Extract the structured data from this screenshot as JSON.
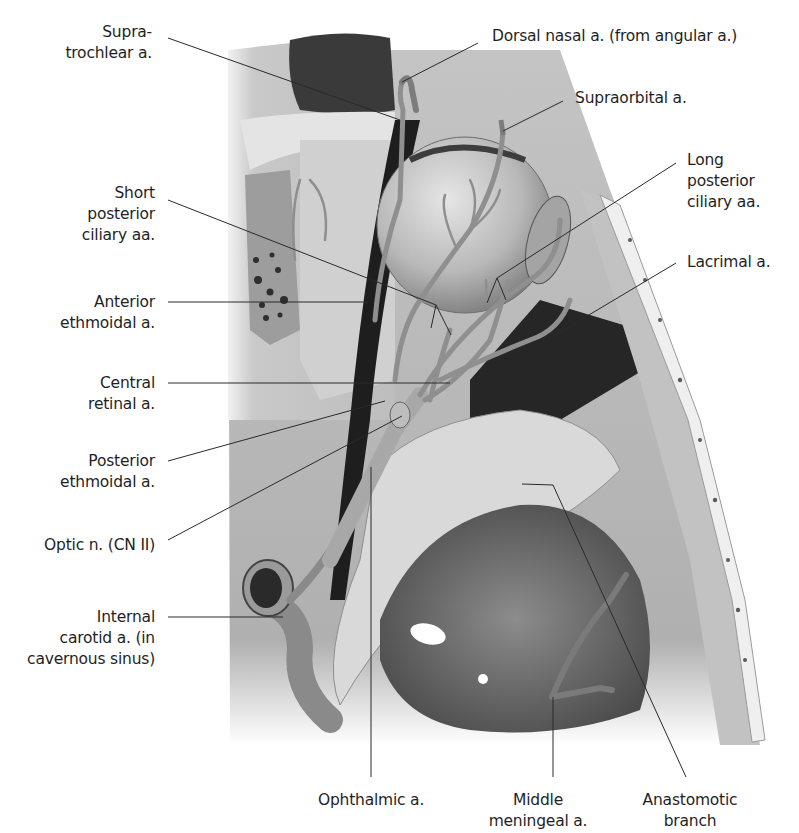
{
  "figure": {
    "colors": {
      "background": "#ffffff",
      "leader_line": "#2a2a2a",
      "label_text": "#1f1f1f",
      "bone_light": "#d4d4d4",
      "bone_mid": "#a9a9a9",
      "tissue_dark": "#2b2b2b",
      "artery": "#8a8a8a",
      "eyeball": "#bdbdbd"
    }
  },
  "labels": {
    "supratrochlear": {
      "lines": [
        "Supra-",
        "trochlear a."
      ]
    },
    "dorsal_nasal": {
      "lines": [
        "Dorsal nasal a. (from angular a.)"
      ]
    },
    "supraorbital": {
      "lines": [
        "Supraorbital a."
      ]
    },
    "long_posterior_ciliary": {
      "lines": [
        "Long",
        "posterior",
        "ciliary aa."
      ]
    },
    "lacrimal": {
      "lines": [
        "Lacrimal a."
      ]
    },
    "short_posterior_ciliary": {
      "lines": [
        "Short",
        "posterior",
        "ciliary aa."
      ]
    },
    "anterior_ethmoidal": {
      "lines": [
        "Anterior",
        "ethmoidal a."
      ]
    },
    "central_retinal": {
      "lines": [
        "Central",
        "retinal a."
      ]
    },
    "posterior_ethmoidal": {
      "lines": [
        "Posterior",
        "ethmoidal a."
      ]
    },
    "optic_nerve": {
      "lines": [
        "Optic n. (CN II)"
      ]
    },
    "internal_carotid": {
      "lines": [
        "Internal",
        "carotid a. (in",
        "cavernous sinus)"
      ]
    },
    "ophthalmic": {
      "lines": [
        "Ophthalmic a."
      ]
    },
    "middle_meningeal": {
      "lines": [
        "Middle",
        "meningeal a."
      ]
    },
    "anastomotic_branch": {
      "lines": [
        "Anastomotic",
        "branch"
      ]
    }
  }
}
